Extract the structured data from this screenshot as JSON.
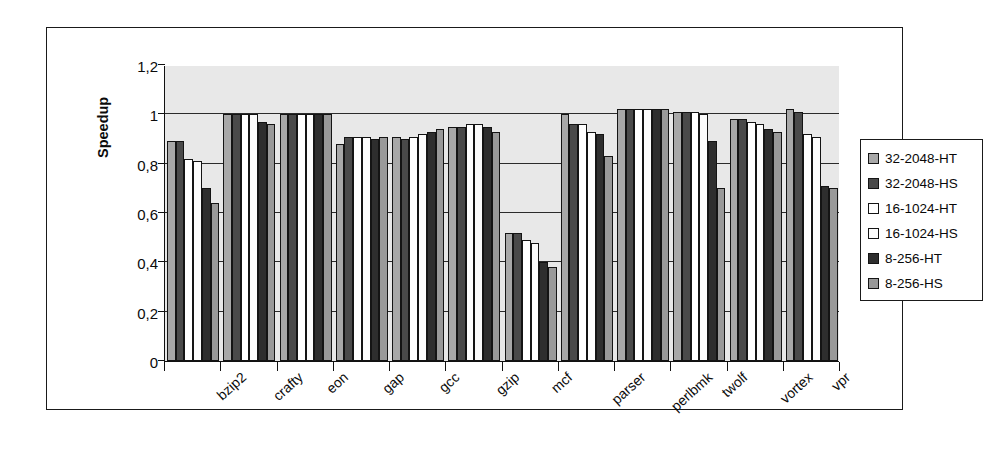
{
  "chart_data": {
    "type": "bar",
    "title": "",
    "subtitle": "",
    "xlabel": "",
    "ylabel": "Speedup",
    "ylim": [
      0,
      1.2
    ],
    "ytick_labels": [
      "1,2",
      "1",
      "0,8",
      "0,6",
      "0,4",
      "0,2",
      "0"
    ],
    "ytick_values": [
      1.2,
      1.0,
      0.8,
      0.6,
      0.4,
      0.2,
      0
    ],
    "grid": true,
    "grid_axis": "y",
    "legend_position": "right",
    "categories": [
      "bzip2",
      "crafty",
      "eon",
      "gap",
      "gcc",
      "gzip",
      "mcf",
      "parser",
      "perlbmk",
      "twolf",
      "vortex",
      "vpr"
    ],
    "series": [
      {
        "name": "32-2048-HT",
        "color": "#a8a8a8",
        "values": [
          0.89,
          1.0,
          1.0,
          0.88,
          0.91,
          0.95,
          0.52,
          1.0,
          1.02,
          1.01,
          0.98,
          1.02
        ]
      },
      {
        "name": "32-2048-HS",
        "color": "#4a4a4a",
        "values": [
          0.89,
          1.0,
          1.0,
          0.91,
          0.9,
          0.95,
          0.52,
          0.96,
          1.02,
          1.01,
          0.98,
          1.01
        ]
      },
      {
        "name": "16-1024-HT",
        "color": "#ffffff",
        "values": [
          0.82,
          1.0,
          1.0,
          0.91,
          0.91,
          0.96,
          0.49,
          0.96,
          1.02,
          1.01,
          0.97,
          0.92
        ]
      },
      {
        "name": "16-1024-HS",
        "color": "#fcfcfc",
        "values": [
          0.81,
          1.0,
          1.0,
          0.91,
          0.92,
          0.96,
          0.48,
          0.93,
          1.02,
          1.0,
          0.96,
          0.91
        ]
      },
      {
        "name": "8-256-HT",
        "color": "#2e2e2e",
        "values": [
          0.7,
          0.97,
          1.0,
          0.9,
          0.93,
          0.95,
          0.4,
          0.92,
          1.02,
          0.89,
          0.94,
          0.71
        ]
      },
      {
        "name": "8-256-HS",
        "color": "#999999",
        "values": [
          0.64,
          0.96,
          1.0,
          0.91,
          0.94,
          0.93,
          0.38,
          0.83,
          1.02,
          0.7,
          0.93,
          0.7
        ]
      }
    ]
  },
  "legend": {
    "items": [
      {
        "label": "32-2048-HT",
        "swatch": "#a8a8a8"
      },
      {
        "label": "32-2048-HS",
        "swatch": "#4a4a4a"
      },
      {
        "label": "16-1024-HT",
        "swatch": "#ffffff"
      },
      {
        "label": "16-1024-HS",
        "swatch": "#fcfcfc"
      },
      {
        "label": "8-256-HT",
        "swatch": "#2e2e2e"
      },
      {
        "label": "8-256-HS",
        "swatch": "#999999"
      }
    ]
  },
  "axis": {
    "y_title": "Speedup"
  }
}
